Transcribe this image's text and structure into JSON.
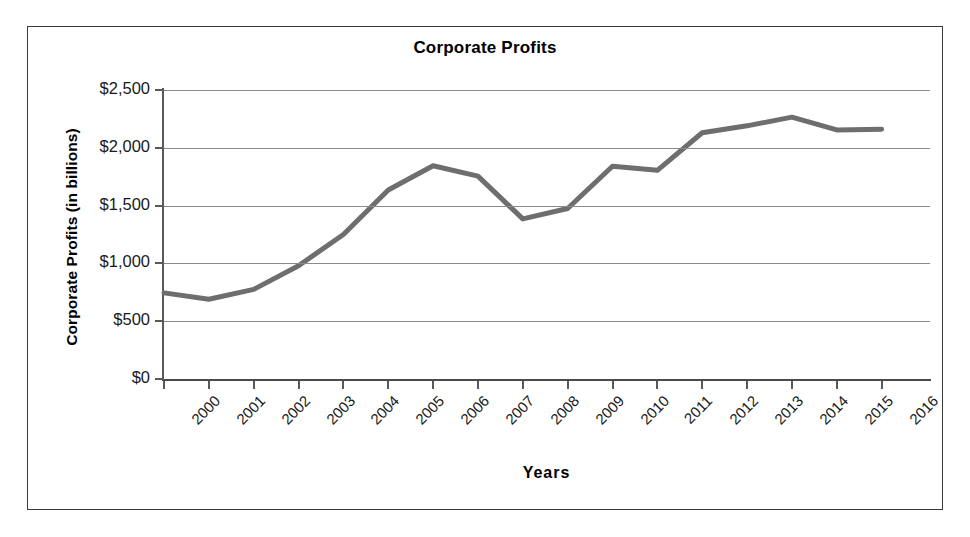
{
  "figure": {
    "title": "Corporate Profits"
  },
  "chart_data": {
    "type": "line",
    "title": "Corporate Profits",
    "xlabel": "Years",
    "ylabel": "Corporate Profits (in billions)",
    "categories": [
      "2000",
      "2001",
      "2002",
      "2003",
      "2004",
      "2005",
      "2006",
      "2007",
      "2008",
      "2009",
      "2010",
      "2011",
      "2012",
      "2013",
      "2014",
      "2015",
      "2016"
    ],
    "values": [
      745,
      690,
      775,
      980,
      1250,
      1635,
      1845,
      1755,
      1385,
      1475,
      1840,
      1805,
      2130,
      2190,
      2265,
      2155,
      2160
    ],
    "ylim": [
      0,
      2500
    ],
    "yticks": [
      0,
      500,
      1000,
      1500,
      2000,
      2500
    ],
    "ytick_labels": [
      "$0",
      "$500",
      "$1,000",
      "$1,500",
      "$2,000",
      "$2,500"
    ],
    "grid": true,
    "legend": "none",
    "series_color": "#6e6e6e",
    "grid_color": "#8a8a8a",
    "axis_color": "#595959"
  }
}
